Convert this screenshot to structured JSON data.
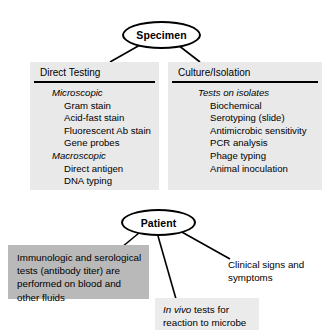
{
  "diagram": {
    "nodes": {
      "specimen": "Specimen",
      "patient": "Patient"
    },
    "panels": [
      {
        "id": "direct-testing",
        "title": "Direct Testing",
        "groups": [
          {
            "heading": "Microscopic",
            "items": [
              "Gram stain",
              "Acid-fast stain",
              "Fluorescent Ab stain",
              "Gene probes"
            ]
          },
          {
            "heading": "Macroscopic",
            "items": [
              "Direct antigen",
              "DNA typing"
            ]
          }
        ]
      },
      {
        "id": "culture-isolation",
        "title": "Culture/Isolation",
        "groups": [
          {
            "heading": "Tests on isolates",
            "items": [
              "Biochemical",
              "Serotyping (slide)",
              "Antimicrobic sensitivity",
              "PCR analysis",
              "Phage typing",
              "Animal inoculation"
            ]
          }
        ]
      }
    ],
    "notes": {
      "immunologic": "Immunologic and serological tests (antibody titer) are performed on blood and other fluids",
      "in_vivo_italic": "In vivo",
      "in_vivo_rest": " tests for reaction to microbe",
      "clinical": "Clinical signs and symptoms"
    },
    "colors": {
      "panel_fill": "#e9e9e9",
      "note_dark_fill": "#b9b9b9",
      "note_light_fill": "#ebebeb",
      "stroke": "#000000",
      "background": "#ffffff"
    }
  }
}
